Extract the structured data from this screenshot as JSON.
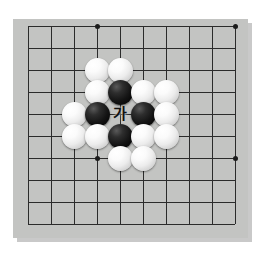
{
  "diagram": {
    "board": {
      "background_color": "#c3c4c2",
      "line_color": "#2b2b2b",
      "shadow_color": "#c9c9c9",
      "columns": 10,
      "rows": 10,
      "cell_width": 23,
      "cell_height": 22,
      "origin_x": 15,
      "origin_y": 7,
      "star_points": [
        {
          "col": 3,
          "row": 0
        },
        {
          "col": 9,
          "row": 0
        },
        {
          "col": 3,
          "row": 6
        },
        {
          "col": 9,
          "row": 6
        }
      ]
    },
    "stones": [
      {
        "color": "white",
        "col": 3,
        "row": 2
      },
      {
        "color": "white",
        "col": 4,
        "row": 2
      },
      {
        "color": "white",
        "col": 3,
        "row": 3
      },
      {
        "color": "black",
        "col": 4,
        "row": 3
      },
      {
        "color": "white",
        "col": 5,
        "row": 3
      },
      {
        "color": "white",
        "col": 6,
        "row": 3
      },
      {
        "color": "white",
        "col": 2,
        "row": 4
      },
      {
        "color": "black",
        "col": 3,
        "row": 4
      },
      {
        "color": "black",
        "col": 5,
        "row": 4
      },
      {
        "color": "white",
        "col": 6,
        "row": 4
      },
      {
        "color": "white",
        "col": 2,
        "row": 5
      },
      {
        "color": "white",
        "col": 3,
        "row": 5
      },
      {
        "color": "black",
        "col": 4,
        "row": 5
      },
      {
        "color": "white",
        "col": 5,
        "row": 5
      },
      {
        "color": "white",
        "col": 6,
        "row": 5
      },
      {
        "color": "white",
        "col": 4,
        "row": 6
      },
      {
        "color": "white",
        "col": 5,
        "row": 6
      }
    ],
    "labels": [
      {
        "text": "가",
        "col": 4,
        "row": 4,
        "color": "#111111"
      }
    ]
  }
}
